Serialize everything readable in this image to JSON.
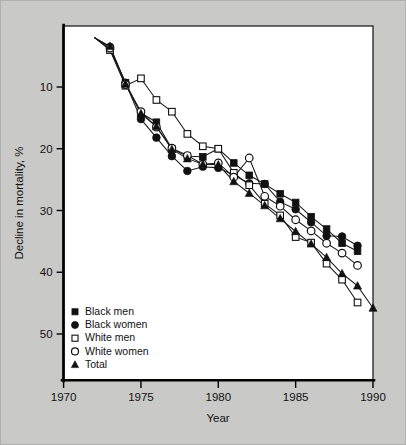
{
  "figure": {
    "background_color": "#c9c9c7",
    "plot_background_color": "#ffffff",
    "ink_color": "#111111"
  },
  "chart_data": {
    "type": "line",
    "title": "",
    "subtitle": "",
    "xlabel": "Year",
    "ylabel": "Decline in mortality, %",
    "xlim": [
      1970,
      1990
    ],
    "ylim": [
      0,
      53.5
    ],
    "y_axis_inverted": true,
    "grid": false,
    "legend_position": "bottom-left",
    "xticks": [
      1970,
      1975,
      1980,
      1985,
      1990
    ],
    "xtick_labels": [
      "1970",
      "1975",
      "1980",
      "1985",
      "1990"
    ],
    "yticks": [
      10,
      20,
      30,
      40,
      50
    ],
    "ytick_labels": [
      "10",
      "20",
      "30",
      "40",
      "50"
    ],
    "series": [
      {
        "name": "Black men",
        "marker": "filled-square",
        "x": [
          1972,
          1973,
          1974,
          1975,
          1976,
          1977,
          1978,
          1979,
          1980,
          1981,
          1982,
          1983,
          1984,
          1985,
          1986,
          1987,
          1988,
          1989
        ],
        "values": [
          2.0,
          4.0,
          9.3,
          14.2,
          15.7,
          20.0,
          21.2,
          21.3,
          20.0,
          22.3,
          24.3,
          25.7,
          27.3,
          28.7,
          31.0,
          33.0,
          35.3,
          36.6
        ]
      },
      {
        "name": "Black women",
        "marker": "filled-circle",
        "x": [
          1972,
          1973,
          1974,
          1975,
          1976,
          1977,
          1978,
          1979,
          1980,
          1981,
          1982,
          1983,
          1984,
          1985,
          1986,
          1987,
          1988,
          1989
        ],
        "values": [
          2.0,
          3.5,
          9.3,
          15.2,
          18.2,
          21.2,
          23.6,
          22.9,
          23.1,
          24.3,
          25.6,
          25.7,
          28.6,
          29.8,
          31.9,
          34.1,
          34.2,
          35.7
        ]
      },
      {
        "name": "White men",
        "marker": "open-square",
        "x": [
          1972,
          1973,
          1974,
          1975,
          1976,
          1977,
          1978,
          1979,
          1980,
          1981,
          1982,
          1983,
          1984,
          1985,
          1986,
          1987,
          1988,
          1989
        ],
        "values": [
          2.0,
          4.0,
          9.8,
          8.6,
          12.1,
          14.0,
          17.6,
          19.6,
          20.0,
          23.9,
          25.9,
          28.9,
          30.8,
          34.3,
          35.2,
          38.6,
          41.2,
          44.9
        ]
      },
      {
        "name": "White women",
        "marker": "open-circle",
        "x": [
          1972,
          1973,
          1974,
          1975,
          1976,
          1977,
          1978,
          1979,
          1980,
          1981,
          1982,
          1983,
          1984,
          1985,
          1986,
          1987,
          1988,
          1989
        ],
        "values": [
          2.0,
          3.7,
          9.6,
          14.0,
          16.5,
          19.9,
          21.1,
          22.5,
          22.3,
          24.6,
          21.5,
          27.7,
          29.3,
          31.5,
          33.3,
          35.3,
          36.9,
          38.9
        ]
      },
      {
        "name": "Total",
        "marker": "filled-triangle",
        "x": [
          1972,
          1973,
          1974,
          1975,
          1976,
          1977,
          1978,
          1979,
          1980,
          1981,
          1982,
          1983,
          1984,
          1985,
          1986,
          1987,
          1988,
          1989,
          1990
        ],
        "values": [
          2.0,
          3.4,
          9.5,
          14.3,
          16.4,
          20.1,
          21.6,
          22.5,
          22.6,
          25.3,
          27.2,
          29.2,
          31.3,
          33.4,
          35.4,
          37.6,
          40.2,
          42.2,
          45.8
        ]
      }
    ]
  },
  "legend": {
    "items": [
      {
        "label": "Black men",
        "marker": "filled-square"
      },
      {
        "label": "Black women",
        "marker": "filled-circle"
      },
      {
        "label": "White men",
        "marker": "open-square"
      },
      {
        "label": "White women",
        "marker": "open-circle"
      },
      {
        "label": "Total",
        "marker": "filled-triangle"
      }
    ]
  }
}
